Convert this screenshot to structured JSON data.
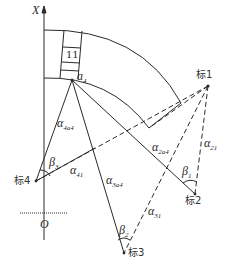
{
  "axes": {
    "x_label": "X",
    "origin_label": "O"
  },
  "segment_label": "11",
  "point_label": {
    "main": "a",
    "sub": "4"
  },
  "stations": [
    {
      "id": "1",
      "label": "标1"
    },
    {
      "id": "2",
      "label": "标2"
    },
    {
      "id": "3",
      "label": "标3"
    },
    {
      "id": "4",
      "label": "标4"
    }
  ],
  "angles": {
    "alpha_4a4": {
      "main": "α",
      "sub": "4a4"
    },
    "alpha_2a4": {
      "main": "α",
      "sub": "2a4"
    },
    "alpha_3a4": {
      "main": "α",
      "sub": "3a4"
    },
    "alpha_41": {
      "main": "α",
      "sub": "41"
    },
    "alpha_31": {
      "main": "α",
      "sub": "31"
    },
    "alpha_21": {
      "main": "α",
      "sub": "21"
    },
    "beta_1": {
      "main": "β",
      "sub": "1"
    },
    "beta_2": {
      "main": "β",
      "sub": "2"
    },
    "beta_3": {
      "main": "β",
      "sub": "3"
    }
  },
  "colors": {
    "line": "#2a2a2a",
    "background": "#ffffff"
  }
}
